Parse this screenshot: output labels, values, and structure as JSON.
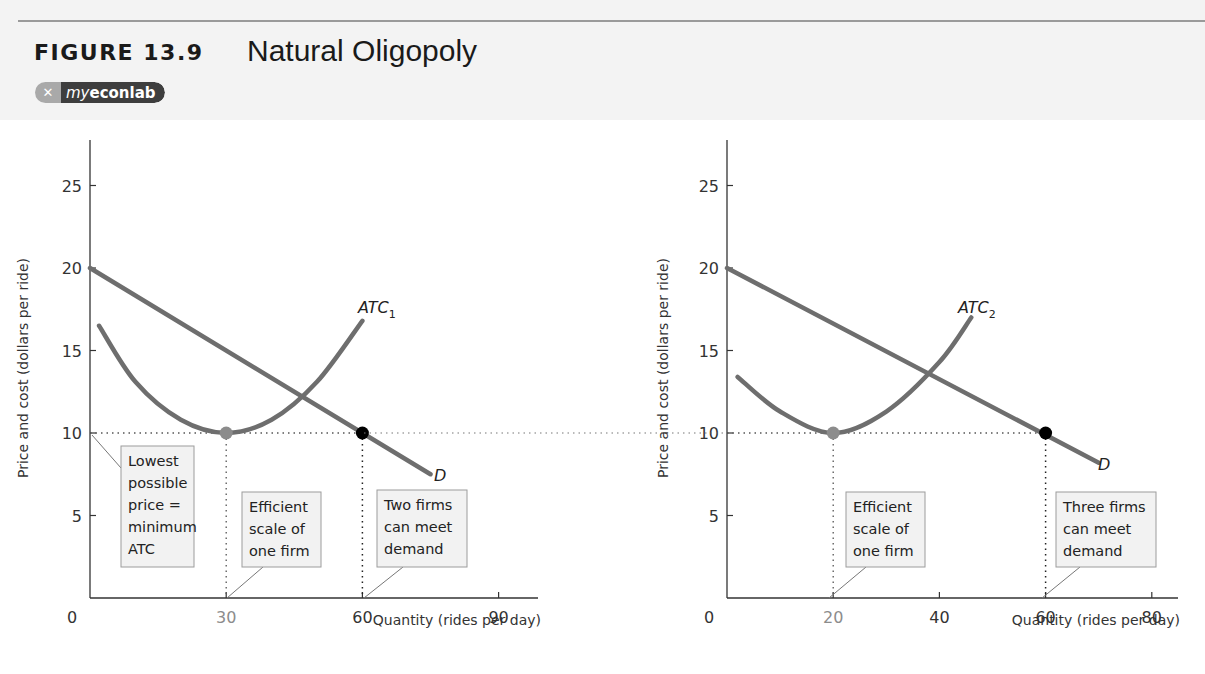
{
  "header": {
    "figure_label": "FIGURE 13.9",
    "figure_title": "Natural Oligopoly",
    "logo_prefix": "my",
    "logo_main": "econlab",
    "logo_icon": "x-swirl-icon"
  },
  "colors": {
    "curve": "#6e6e6e",
    "min_point": "#8c8c8c",
    "eq_point": "#000000",
    "box_fill": "#f2f2f2",
    "box_border": "#9c9c9c",
    "axis": "#333333"
  },
  "chart_data": [
    {
      "type": "line",
      "title": "Natural Oligopoly — ATC1",
      "xlabel": "Quantity (rides per day)",
      "ylabel": "Price and cost (dollars per ride)",
      "xlim": [
        0,
        100
      ],
      "ylim": [
        0,
        28
      ],
      "x_ticks": [
        "0",
        "30",
        "60",
        "90"
      ],
      "y_ticks": [
        "5",
        "10",
        "15",
        "20",
        "25"
      ],
      "grid": false,
      "series": [
        {
          "name": "D",
          "x": [
            0,
            75
          ],
          "values": [
            20,
            7.5
          ]
        },
        {
          "name": "ATC1",
          "x": [
            2,
            10,
            20,
            30,
            40,
            50,
            60
          ],
          "values": [
            16.5,
            13.1,
            10.8,
            10,
            10.8,
            13.1,
            16.8
          ]
        }
      ],
      "points": [
        {
          "name": "minimum ATC",
          "x": 30,
          "y": 10,
          "color": "gray"
        },
        {
          "name": "demand at min ATC",
          "x": 60,
          "y": 10,
          "color": "black"
        }
      ],
      "curve_labels": {
        "demand": "D",
        "atc_main": "ATC",
        "atc_sub": "1"
      },
      "annotations": [
        {
          "lines": [
            "Lowest",
            "possible",
            "price =",
            "minimum",
            "ATC"
          ]
        },
        {
          "lines": [
            "Efficient",
            "scale of",
            "one firm"
          ]
        },
        {
          "lines": [
            "Two firms",
            "can meet",
            "demand"
          ]
        }
      ]
    },
    {
      "type": "line",
      "title": "Natural Oligopoly — ATC2",
      "xlabel": "Quantity (rides per day)",
      "ylabel": "Price and cost (dollars per ride)",
      "xlim": [
        0,
        85
      ],
      "ylim": [
        0,
        28
      ],
      "x_ticks": [
        "0",
        "20",
        "40",
        "60",
        "80"
      ],
      "y_ticks": [
        "5",
        "10",
        "15",
        "20",
        "25"
      ],
      "grid": false,
      "series": [
        {
          "name": "D",
          "x": [
            0,
            70
          ],
          "values": [
            20,
            8.2
          ]
        },
        {
          "name": "ATC2",
          "x": [
            2,
            10,
            20,
            30,
            40,
            46
          ],
          "values": [
            13.4,
            11.3,
            10,
            11.3,
            14.3,
            17
          ]
        }
      ],
      "points": [
        {
          "name": "minimum ATC",
          "x": 20,
          "y": 10,
          "color": "gray"
        },
        {
          "name": "demand at min ATC",
          "x": 60,
          "y": 10,
          "color": "black"
        }
      ],
      "curve_labels": {
        "demand": "D",
        "atc_main": "ATC",
        "atc_sub": "2"
      },
      "annotations": [
        {
          "lines": [
            "Efficient",
            "scale of",
            "one firm"
          ]
        },
        {
          "lines": [
            "Three firms",
            "can meet",
            "demand"
          ]
        }
      ]
    }
  ]
}
